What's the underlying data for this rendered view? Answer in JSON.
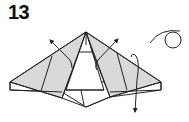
{
  "step": {
    "number": "13"
  },
  "diagram": {
    "colors": {
      "stroke": "#222222",
      "shade": "#d9d9d9",
      "paper": "#ffffff"
    },
    "symbols": [
      "left-unfold-arrow",
      "right-unfold-arrow",
      "right-hooked-down-arrow",
      "eye-view-symbol"
    ]
  }
}
